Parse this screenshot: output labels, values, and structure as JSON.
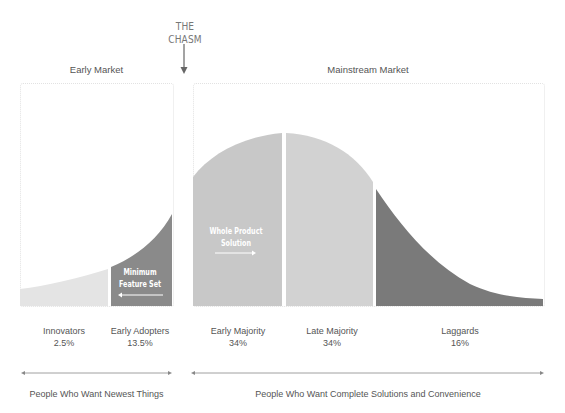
{
  "header": {
    "chasm_label": "THE CHASM",
    "early_market_label": "Early Market",
    "mainstream_market_label": "Mainstream Market"
  },
  "segments": [
    {
      "name": "Innovators",
      "percent": "2.5%",
      "color": "#e4e4e4"
    },
    {
      "name": "Early Adopters",
      "percent": "13.5%",
      "color": "#8a8a8a"
    },
    {
      "name": "Early Majority",
      "percent": "34%",
      "color": "#c8c8c8"
    },
    {
      "name": "Late Majority",
      "percent": "34%",
      "color": "#d2d2d2"
    },
    {
      "name": "Laggards",
      "percent": "16%",
      "color": "#7a7a7a"
    }
  ],
  "annotations": {
    "minimum_feature_set": [
      "Minimum",
      "Feature Set"
    ],
    "whole_product_solution": [
      "Whole Product",
      "Solution"
    ]
  },
  "footer": {
    "left_label": "People Who Want Newest Things",
    "right_label": "People Who Want Complete Solutions and Convenience"
  }
}
